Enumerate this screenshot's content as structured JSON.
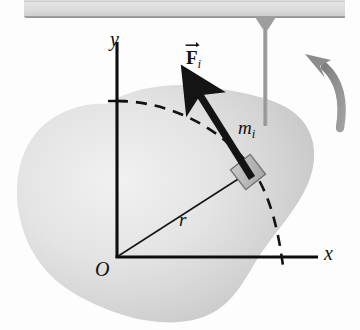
{
  "figure": {
    "background_color": "#fdfdfd"
  },
  "labels": {
    "y_axis": "y",
    "x_axis": "x",
    "origin": "O",
    "radius": "r",
    "mass_base": "m",
    "mass_sub": "i",
    "force_base": "F",
    "force_sub": "i"
  },
  "elements": {
    "ceiling_bar": {
      "name": "support-bar",
      "fill": "#dcdcdc",
      "edge": "#9a9a9a"
    },
    "rod": {
      "name": "axle-rod",
      "fill": "#a8a8a8"
    },
    "body_blob": {
      "name": "rigid-body",
      "fill_light": "#eeeeee",
      "fill_dark": "#c6c6c6"
    },
    "mass_block": {
      "name": "mass-element-block",
      "fill": "#b9b9b9",
      "stroke": "#6a6a6a"
    },
    "force_arrow": {
      "name": "force-vector-arrow",
      "color": "#1a1a1a"
    },
    "rotation_arrow": {
      "name": "rotation-direction-arrow",
      "color": "#8d8d8d"
    },
    "dashed_arc": {
      "name": "circular-path-arc",
      "color": "#121212"
    },
    "axes": {
      "name": "coordinate-axes",
      "color": "#0d0d0d"
    },
    "radius_line": {
      "name": "radius-line",
      "color": "#141414"
    }
  }
}
